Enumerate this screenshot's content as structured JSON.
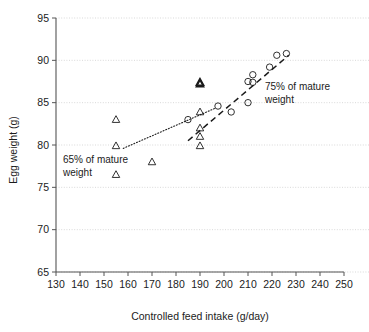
{
  "chart_data": {
    "type": "scatter",
    "title": "",
    "xlabel": "Controlled feed intake (g/day)",
    "ylabel": "Egg weight (g)",
    "xlim": [
      130,
      250
    ],
    "ylim": [
      65,
      95
    ],
    "xticks": [
      130,
      140,
      150,
      160,
      170,
      180,
      190,
      200,
      210,
      220,
      230,
      240,
      250
    ],
    "yticks": [
      65,
      70,
      75,
      80,
      85,
      90,
      95
    ],
    "grid": "horizontal-dotted",
    "legend_position": "inline-annotations",
    "series": [
      {
        "name": "65% of mature weight",
        "marker": "triangle",
        "points": [
          {
            "x": 155,
            "y": 83.0
          },
          {
            "x": 155,
            "y": 79.9
          },
          {
            "x": 155,
            "y": 76.5
          },
          {
            "x": 170,
            "y": 78.0
          },
          {
            "x": 190,
            "y": 87.4
          },
          {
            "x": 190,
            "y": 87.2
          },
          {
            "x": 190,
            "y": 83.9
          },
          {
            "x": 190,
            "y": 82.0
          },
          {
            "x": 190,
            "y": 81.0
          },
          {
            "x": 190,
            "y": 79.9
          }
        ]
      },
      {
        "name": "75% of mature weight",
        "marker": "circle",
        "points": [
          {
            "x": 185,
            "y": 83.0
          },
          {
            "x": 197.5,
            "y": 84.6
          },
          {
            "x": 203,
            "y": 83.9
          },
          {
            "x": 210,
            "y": 87.5
          },
          {
            "x": 210,
            "y": 85.0
          },
          {
            "x": 212,
            "y": 88.3
          },
          {
            "x": 212,
            "y": 87.4
          },
          {
            "x": 219,
            "y": 89.2
          },
          {
            "x": 222,
            "y": 90.6
          },
          {
            "x": 226,
            "y": 90.8
          }
        ]
      }
    ],
    "trendlines": [
      {
        "name": "dotted-lower-segment",
        "style": "dotted",
        "from": {
          "x": 158,
          "y": 79.6
        },
        "to": {
          "x": 196,
          "y": 84.3
        }
      },
      {
        "name": "dashed-upper-segment",
        "style": "dashed",
        "from": {
          "x": 185,
          "y": 80.5
        },
        "to": {
          "x": 227,
          "y": 90.6
        }
      }
    ],
    "annotations": [
      {
        "name": "annotation-65-percent",
        "line1": "65% of mature",
        "line2": "weight",
        "x": 152,
        "y": 78.3
      },
      {
        "name": "annotation-75-percent",
        "line1": "75% of mature",
        "line2": "weight",
        "x": 224,
        "y": 87.1
      }
    ]
  },
  "axes": {
    "x_title": "Controlled feed intake (g/day)",
    "y_title": "Egg weight (g)",
    "x_tick_labels": [
      "130",
      "140",
      "150",
      "160",
      "170",
      "180",
      "190",
      "200",
      "210",
      "220",
      "230",
      "240",
      "250"
    ],
    "y_tick_labels": [
      "65",
      "70",
      "75",
      "80",
      "85",
      "90",
      "95"
    ]
  },
  "annotations": {
    "left": {
      "line1": "65% of mature",
      "line2": "weight"
    },
    "right": {
      "line1": "75% of mature",
      "line2": "weight"
    }
  },
  "colors": {
    "marker": "#1b1b1b",
    "axis": "#555555",
    "gridline": "#c9c9c9",
    "background": "#ffffff"
  }
}
